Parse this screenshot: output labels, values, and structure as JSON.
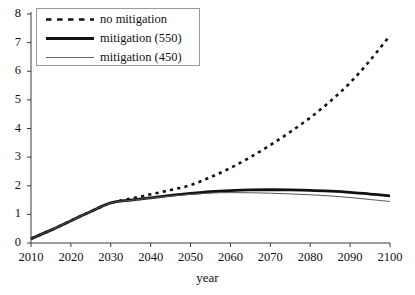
{
  "chart_data": {
    "type": "line",
    "title": "",
    "xlabel": "year",
    "ylabel": "",
    "xlim": [
      2010,
      2100
    ],
    "ylim": [
      0,
      8
    ],
    "xticks": [
      "2010",
      "2020",
      "2030",
      "2040",
      "2050",
      "2060",
      "2070",
      "2080",
      "2090",
      "2100"
    ],
    "yticks": [
      "0",
      "1",
      "2",
      "3",
      "4",
      "5",
      "6",
      "7",
      "8"
    ],
    "grid": false,
    "legend_position": "top-left",
    "x": [
      2010,
      2015,
      2020,
      2025,
      2030,
      2035,
      2040,
      2045,
      2050,
      2055,
      2060,
      2065,
      2070,
      2075,
      2080,
      2085,
      2090,
      2095,
      2100
    ],
    "series": [
      {
        "name": "no mitigation",
        "style": "dashed",
        "color": "#111111",
        "width": 2.6,
        "values": [
          0.15,
          0.45,
          0.78,
          1.1,
          1.4,
          1.55,
          1.7,
          1.85,
          2.02,
          2.3,
          2.62,
          3.0,
          3.42,
          3.88,
          4.38,
          4.95,
          5.6,
          6.38,
          7.25
        ]
      },
      {
        "name": "mitigation (550)",
        "style": "solid-thick",
        "color": "#111111",
        "width": 2.8,
        "values": [
          0.15,
          0.45,
          0.78,
          1.1,
          1.4,
          1.5,
          1.58,
          1.66,
          1.73,
          1.79,
          1.83,
          1.855,
          1.86,
          1.855,
          1.84,
          1.81,
          1.77,
          1.71,
          1.65
        ]
      },
      {
        "name": "mitigation (450)",
        "style": "solid-thin",
        "color": "#555555",
        "width": 1.0,
        "values": [
          0.15,
          0.45,
          0.78,
          1.1,
          1.4,
          1.49,
          1.57,
          1.64,
          1.7,
          1.745,
          1.76,
          1.755,
          1.74,
          1.715,
          1.685,
          1.645,
          1.59,
          1.52,
          1.45
        ]
      }
    ]
  },
  "legend": {
    "items": [
      {
        "label": "no mitigation"
      },
      {
        "label": "mitigation (550)"
      },
      {
        "label": "mitigation (450)"
      }
    ]
  },
  "axis": {
    "x_title": "year"
  }
}
